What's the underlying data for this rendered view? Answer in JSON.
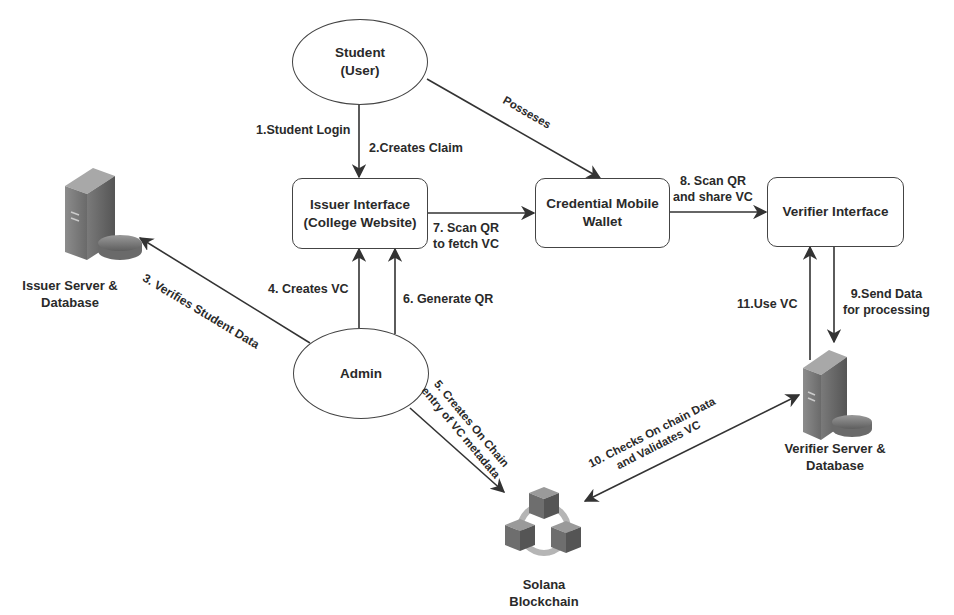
{
  "diagram": {
    "type": "verifiable-credential-flow",
    "nodes": {
      "student": {
        "line1": "Student",
        "line2": "(User)",
        "shape": "ellipse"
      },
      "issuer_interface": {
        "line1": "Issuer Interface",
        "line2": "(College Website)",
        "shape": "rounded-rect"
      },
      "wallet": {
        "line1": "Credential Mobile",
        "line2": "Wallet",
        "shape": "rounded-rect"
      },
      "verifier_interface": {
        "line1": "Verifier Interface",
        "shape": "rounded-rect"
      },
      "admin": {
        "line1": "Admin",
        "shape": "ellipse"
      },
      "issuer_server": {
        "line1": "Issuer Server &",
        "line2": "Database",
        "icon": "server-database-icon"
      },
      "verifier_server": {
        "line1": "Verifier Server &",
        "line2": "Database",
        "icon": "server-database-icon"
      },
      "blockchain": {
        "line1": "Solana",
        "line2": "Blockchain",
        "icon": "blockchain-cubes-icon"
      }
    },
    "edges": {
      "e1": {
        "line1": "1.Student Login",
        "from": "student",
        "to": "issuer_interface"
      },
      "e2": {
        "line1": "2.Creates Claim",
        "from": "student",
        "to": "issuer_interface"
      },
      "possesses": {
        "line1": "Posseses",
        "from": "student",
        "to": "wallet"
      },
      "e3": {
        "line1": "3. Verifies Student Data",
        "from": "admin",
        "to": "issuer_server"
      },
      "e4": {
        "line1": "4. Creates VC",
        "from": "admin",
        "to": "issuer_interface"
      },
      "e5": {
        "line1": "5. Creates On Chain",
        "line2": "entry of VC metadata",
        "from": "admin",
        "to": "blockchain"
      },
      "e6": {
        "line1": "6. Generate QR",
        "from": "admin",
        "to": "issuer_interface"
      },
      "e7": {
        "line1": "7. Scan QR",
        "line2": "to fetch VC",
        "from": "issuer_interface",
        "to": "wallet"
      },
      "e8": {
        "line1": "8. Scan QR",
        "line2": "and share VC",
        "from": "wallet",
        "to": "verifier_interface"
      },
      "e9": {
        "line1": "9.Send Data",
        "line2": "for processing",
        "from": "verifier_interface",
        "to": "verifier_server"
      },
      "e10": {
        "line1": "10. Checks On chain Data",
        "line2": "and Validates VC",
        "from": "verifier_server",
        "to": "blockchain",
        "bidirectional": true
      },
      "e11": {
        "line1": "11.Use VC",
        "from": "verifier_server",
        "to": "verifier_interface"
      }
    },
    "colors": {
      "stroke": "#444444",
      "text": "#2a2a2a",
      "background": "#ffffff",
      "icon_dark": "#5a5a5a",
      "icon_light": "#9a9a9a"
    }
  }
}
